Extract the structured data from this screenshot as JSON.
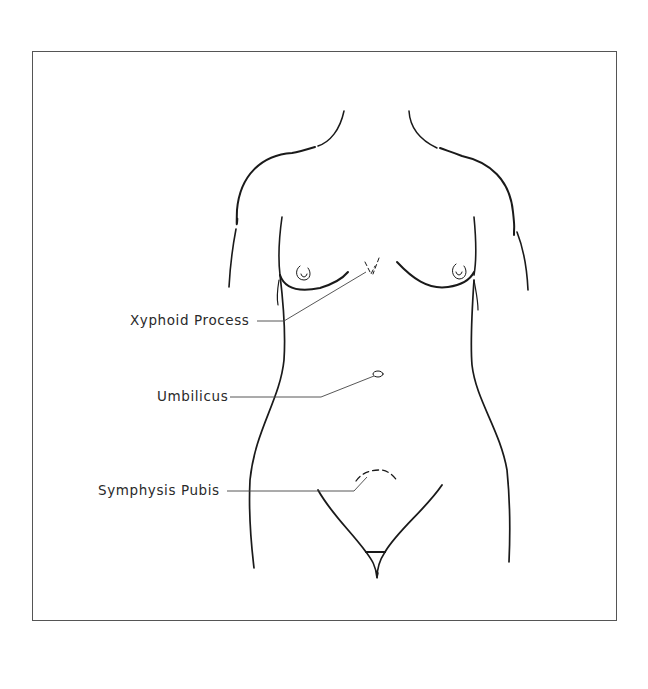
{
  "figure": {
    "labels": [
      {
        "id": "xyphoid",
        "text": "Xyphoid Process"
      },
      {
        "id": "umbilicus",
        "text": "Umbilicus"
      },
      {
        "id": "symphysis",
        "text": "Symphysis Pubis"
      }
    ]
  },
  "colors": {
    "line": "#1a1a1a",
    "leader": "#444444",
    "frame": "#555555",
    "background": "#ffffff"
  }
}
